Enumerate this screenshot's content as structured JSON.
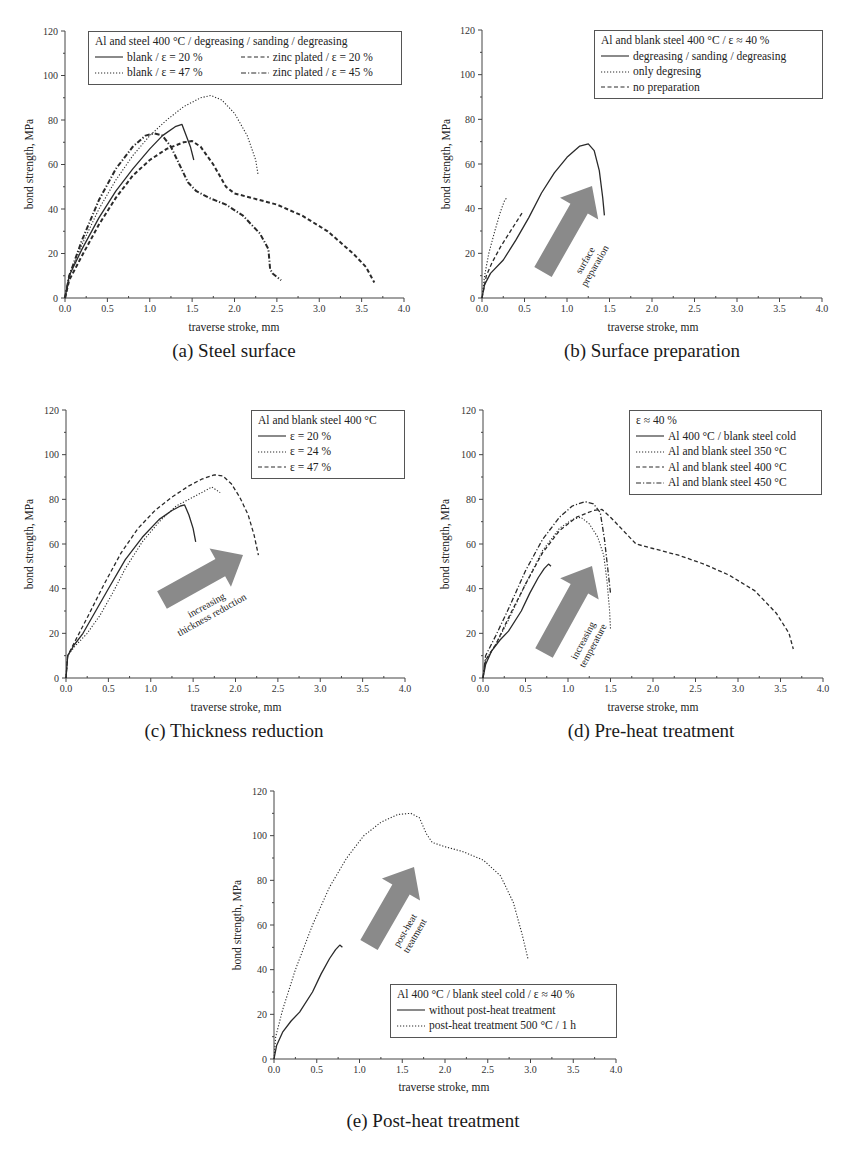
{
  "figure": {
    "colors": {
      "axis": "#444444",
      "line": "#2a2a2a",
      "arrow": "#8a8a8a",
      "legend_border": "#555555"
    }
  },
  "chart_data": [
    {
      "id": "a",
      "type": "line",
      "caption": "(a) Steel surface",
      "xlabel": "traverse stroke, mm",
      "ylabel": "bond strength, MPa",
      "xlim": [
        0,
        4.0
      ],
      "ylim": [
        0,
        120
      ],
      "xticks": [
        "0.0",
        "0.5",
        "1.0",
        "1.5",
        "2.0",
        "2.5",
        "3.0",
        "3.5",
        "4.0"
      ],
      "yticks": [
        "0",
        "20",
        "40",
        "60",
        "80",
        "100",
        "120"
      ],
      "grid": false,
      "legend": {
        "position": "upper-right",
        "title": "Al and steel 400 °C / degreasing / sanding / degreasing",
        "columns": 2,
        "entries": [
          "blank / ε = 20 %",
          "blank / ε = 47 %",
          "zinc plated / ε = 20 %",
          "zinc plated / ε = 45 %"
        ]
      },
      "series": [
        {
          "name": "blank / ε = 20 %",
          "style": "solid",
          "x": [
            0,
            0.05,
            0.2,
            0.4,
            0.6,
            0.8,
            1.0,
            1.15,
            1.3,
            1.38,
            1.42,
            1.48,
            1.52
          ],
          "y": [
            0,
            10,
            22,
            36,
            48,
            58,
            67,
            73,
            77,
            78,
            74,
            68,
            62
          ]
        },
        {
          "name": "blank / ε = 47 %",
          "style": "dotted",
          "x": [
            0,
            0.05,
            0.2,
            0.4,
            0.6,
            0.8,
            1.0,
            1.2,
            1.4,
            1.6,
            1.72,
            1.85,
            2.0,
            2.15,
            2.25,
            2.28
          ],
          "y": [
            0,
            10,
            24,
            40,
            53,
            64,
            73,
            80,
            86,
            90,
            91,
            89,
            83,
            73,
            62,
            55
          ]
        },
        {
          "name": "zinc plated / ε = 20 %",
          "style": "dashed",
          "x": [
            0,
            0.05,
            0.2,
            0.4,
            0.6,
            0.8,
            1.0,
            1.2,
            1.4,
            1.5,
            1.6,
            1.75,
            1.9,
            2.0,
            2.2,
            2.5,
            2.8,
            3.1,
            3.4,
            3.55,
            3.65
          ],
          "y": [
            0,
            8,
            19,
            33,
            45,
            55,
            62,
            67,
            70,
            70.5,
            68,
            60,
            50,
            47,
            45,
            42,
            37,
            30,
            20,
            14,
            7
          ]
        },
        {
          "name": "zinc plated / ε = 45 %",
          "style": "dashdot",
          "x": [
            0,
            0.05,
            0.2,
            0.4,
            0.6,
            0.8,
            0.95,
            1.05,
            1.15,
            1.25,
            1.35,
            1.45,
            1.55,
            1.7,
            1.9,
            2.1,
            2.3,
            2.4,
            2.42,
            2.45,
            2.55
          ],
          "y": [
            0,
            10,
            26,
            44,
            58,
            68,
            73,
            74,
            73,
            68,
            60,
            52,
            48,
            45,
            42,
            37,
            29,
            22,
            13,
            11,
            8
          ]
        }
      ],
      "annotations": []
    },
    {
      "id": "b",
      "type": "line",
      "caption": "(b) Surface preparation",
      "xlabel": "traverse stroke, mm",
      "ylabel": "bond strength, MPa",
      "xlim": [
        0,
        4.0
      ],
      "ylim": [
        0,
        120
      ],
      "xticks": [
        "0.0",
        "0.5",
        "1.0",
        "1.5",
        "2.0",
        "2.5",
        "3.0",
        "3.5",
        "4.0"
      ],
      "yticks": [
        "0",
        "20",
        "40",
        "60",
        "80",
        "100",
        "120"
      ],
      "grid": false,
      "legend": {
        "position": "upper-right",
        "title": "Al and blank steel 400 °C / ε ≈ 40 %",
        "columns": 1,
        "entries": [
          "degreasing / sanding / degreasing",
          "only degresing",
          "no preparation"
        ]
      },
      "series": [
        {
          "name": "degreasing / sanding / degreasing",
          "style": "solid",
          "x": [
            0,
            0.03,
            0.1,
            0.25,
            0.4,
            0.55,
            0.7,
            0.85,
            1.0,
            1.15,
            1.25,
            1.32,
            1.38,
            1.42,
            1.44
          ],
          "y": [
            0,
            6,
            11,
            17,
            26,
            36,
            47,
            56,
            63,
            68,
            69,
            66,
            57,
            45,
            37
          ]
        },
        {
          "name": "only degresing",
          "style": "dotted",
          "x": [
            0,
            0.03,
            0.08,
            0.15,
            0.22,
            0.27,
            0.3
          ],
          "y": [
            0,
            10,
            20,
            30,
            39,
            44,
            45
          ]
        },
        {
          "name": "no preparation",
          "style": "dashed",
          "x": [
            0,
            0.05,
            0.12,
            0.22,
            0.32,
            0.42,
            0.47
          ],
          "y": [
            0,
            10,
            16,
            23,
            29,
            35,
            38
          ]
        }
      ],
      "annotations": [
        {
          "type": "arrow",
          "text": [
            "surface",
            "preparation"
          ]
        }
      ]
    },
    {
      "id": "c",
      "type": "line",
      "caption": "(c) Thickness reduction",
      "xlabel": "traverse stroke, mm",
      "ylabel": "bond strength, MPa",
      "xlim": [
        0,
        4.0
      ],
      "ylim": [
        0,
        120
      ],
      "xticks": [
        "0.0",
        "0.5",
        "1.0",
        "1.5",
        "2.0",
        "2.5",
        "3.0",
        "3.5",
        "4.0"
      ],
      "yticks": [
        "0",
        "20",
        "40",
        "60",
        "80",
        "100",
        "120"
      ],
      "grid": false,
      "legend": {
        "position": "upper-right",
        "title": "Al and blank steel 400 °C",
        "columns": 1,
        "entries": [
          "ε = 20 %",
          "ε = 24 %",
          "ε = 47 %"
        ]
      },
      "series": [
        {
          "name": "ε = 20 %",
          "style": "solid",
          "x": [
            0,
            0.02,
            0.1,
            0.2,
            0.35,
            0.5,
            0.7,
            0.9,
            1.1,
            1.25,
            1.35,
            1.4,
            1.45,
            1.5,
            1.53
          ],
          "y": [
            0,
            10,
            15,
            20,
            30,
            40,
            53,
            63,
            71,
            75,
            77,
            77.5,
            73,
            67,
            61
          ]
        },
        {
          "name": "ε = 24 %",
          "style": "dotted",
          "x": [
            0,
            0.02,
            0.1,
            0.25,
            0.4,
            0.55,
            0.7,
            0.9,
            1.1,
            1.3,
            1.5,
            1.65,
            1.72,
            1.78,
            1.82
          ],
          "y": [
            0,
            10,
            14,
            20,
            28,
            38,
            49,
            61,
            70,
            77,
            81,
            84,
            85.5,
            84,
            83
          ]
        },
        {
          "name": "ε = 47 %",
          "style": "dashed",
          "x": [
            0,
            0.02,
            0.1,
            0.25,
            0.45,
            0.65,
            0.85,
            1.05,
            1.25,
            1.45,
            1.6,
            1.75,
            1.85,
            1.95,
            2.05,
            2.15,
            2.22,
            2.27
          ],
          "y": [
            0,
            10,
            16,
            27,
            42,
            56,
            67,
            75,
            81,
            86,
            89,
            91,
            90.5,
            87,
            81,
            73,
            64,
            55
          ]
        }
      ],
      "annotations": [
        {
          "type": "arrow",
          "text": [
            "increasing",
            "thickness reduction"
          ]
        }
      ]
    },
    {
      "id": "d",
      "type": "line",
      "caption": "(d) Pre-heat treatment",
      "xlabel": "traverse stroke, mm",
      "ylabel": "bond strength, MPa",
      "xlim": [
        0,
        4.0
      ],
      "ylim": [
        0,
        120
      ],
      "xticks": [
        "0.0",
        "0.5",
        "1.0",
        "1.5",
        "2.0",
        "2.5",
        "3.0",
        "3.5",
        "4.0"
      ],
      "yticks": [
        "0",
        "20",
        "40",
        "60",
        "80",
        "100",
        "120"
      ],
      "grid": false,
      "legend": {
        "position": "upper-right",
        "title": "ε ≈ 40 %",
        "columns": 1,
        "entries": [
          "Al 400 °C / blank steel cold",
          "Al and blank steel 350 °C",
          "Al and blank steel 400 °C",
          "Al and blank steel 450 °C"
        ]
      },
      "series": [
        {
          "name": "Al 400 °C / blank steel cold",
          "style": "solid",
          "x": [
            0,
            0.03,
            0.1,
            0.2,
            0.3,
            0.45,
            0.55,
            0.65,
            0.72,
            0.77,
            0.8
          ],
          "y": [
            0,
            6,
            12,
            17,
            21,
            30,
            38,
            45,
            49,
            51,
            50
          ]
        },
        {
          "name": "Al and blank steel 350 °C",
          "style": "dotted",
          "x": [
            0,
            0.03,
            0.15,
            0.3,
            0.5,
            0.7,
            0.9,
            1.05,
            1.15,
            1.25,
            1.35,
            1.42,
            1.46,
            1.49,
            1.5
          ],
          "y": [
            0,
            8,
            15,
            26,
            42,
            57,
            67,
            71,
            72,
            69,
            63,
            55,
            43,
            30,
            22
          ]
        },
        {
          "name": "Al and blank steel 400 °C",
          "style": "dashed",
          "x": [
            0,
            0.03,
            0.15,
            0.3,
            0.5,
            0.7,
            0.9,
            1.1,
            1.3,
            1.4,
            1.5,
            1.65,
            1.8,
            2.0,
            2.3,
            2.6,
            2.9,
            3.2,
            3.45,
            3.6,
            3.65
          ],
          "y": [
            0,
            8,
            15,
            27,
            42,
            56,
            66,
            72,
            75,
            75.5,
            72,
            66,
            60,
            58,
            55,
            51,
            46,
            39,
            29,
            20,
            13
          ]
        },
        {
          "name": "Al and blank steel 450 °C",
          "style": "dashdot",
          "x": [
            0,
            0.03,
            0.15,
            0.3,
            0.5,
            0.7,
            0.9,
            1.05,
            1.2,
            1.3,
            1.38,
            1.43,
            1.47,
            1.5
          ],
          "y": [
            0,
            10,
            19,
            31,
            48,
            62,
            72,
            77,
            79,
            78,
            74,
            62,
            48,
            38
          ]
        }
      ],
      "annotations": [
        {
          "type": "arrow",
          "text": [
            "increasing",
            "temperature"
          ]
        }
      ]
    },
    {
      "id": "e",
      "type": "line",
      "caption": "(e) Post-heat treatment",
      "xlabel": "traverse stroke, mm",
      "ylabel": "bond strength, MPa",
      "xlim": [
        0,
        4.0
      ],
      "ylim": [
        0,
        120
      ],
      "xticks": [
        "0.0",
        "0.5",
        "1.0",
        "1.5",
        "2.0",
        "2.5",
        "3.0",
        "3.5",
        "4.0"
      ],
      "yticks": [
        "0",
        "20",
        "40",
        "60",
        "80",
        "100",
        "120"
      ],
      "grid": false,
      "legend": {
        "position": "lower-right",
        "title": "Al 400 °C / blank steel cold / ε ≈ 40 %",
        "columns": 1,
        "entries": [
          "without post-heat treatment",
          "post-heat treatment 500 °C / 1 h"
        ]
      },
      "series": [
        {
          "name": "without post-heat treatment",
          "style": "solid",
          "x": [
            0,
            0.03,
            0.1,
            0.2,
            0.3,
            0.45,
            0.55,
            0.65,
            0.72,
            0.77,
            0.8
          ],
          "y": [
            0,
            6,
            12,
            17,
            21,
            30,
            38,
            45,
            49,
            51,
            50
          ]
        },
        {
          "name": "post-heat treatment 500 °C / 1 h",
          "style": "dotted",
          "x": [
            0,
            0.02,
            0.1,
            0.25,
            0.45,
            0.65,
            0.85,
            1.05,
            1.25,
            1.45,
            1.6,
            1.7,
            1.78,
            1.85,
            2.0,
            2.2,
            2.45,
            2.65,
            2.8,
            2.9,
            2.97
          ],
          "y": [
            0,
            10,
            22,
            40,
            60,
            77,
            90,
            100,
            106,
            109.5,
            110,
            108,
            101,
            97,
            95,
            93,
            89,
            82,
            70,
            56,
            45
          ]
        }
      ],
      "annotations": [
        {
          "type": "arrow",
          "text": [
            "post-heat",
            "treatment"
          ]
        }
      ]
    }
  ]
}
